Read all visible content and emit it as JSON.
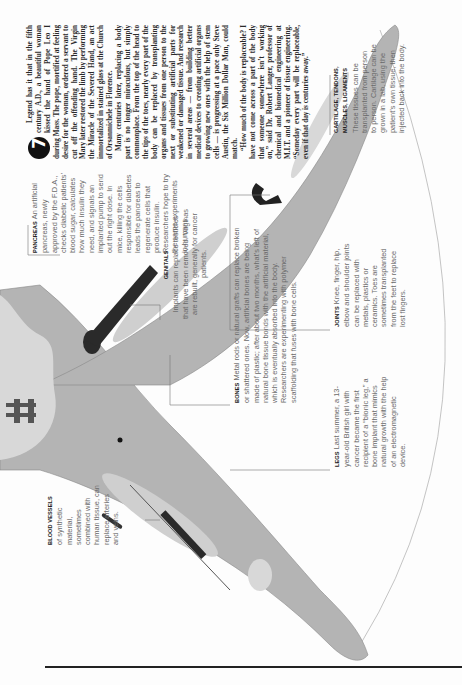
{
  "article": {
    "badge_number": "7",
    "paragraphs": [
      "Legend has it that in the fifth century A.D., a beautiful woman kissed the hand of Pope Leo I during Mass. The pope, mortified at feeling desire for the woman, ordered a servant to cut off the offending hand. The Virgin Mary later restored the limb by performing the Miracle of the Severed Hand, an act immortalized in stained glass at the Church of Orsanmichele in Florence.",
      "Many centuries later, replacing a body part is no longer miraculous, but simply commonplace. From the top of the head to the tips of the toes, nearly every part of the body can be replaced by transplanting organs and tissues from one person to the next or substituting artificial parts for weakened or damaged tissue. And research in several areas — from building better medical devices to creating artificial organs to growing new ones with the help of stem cells — is progressing at a pace only Steve Austin, the Six Million Dollar Man, could match.",
      "“How much of the body is replaceable? I have not come across a part of the body that someone somewhere isn’t working on,” said Dr. Robert Langer, professor of chemical and biomedical engineering at M.I.T. and a pioneer of tissue engineering. “Someday every part will be replaceable, even if that day is centuries away.”"
    ]
  },
  "labels": {
    "pancreas": {
      "heading": "Pancreas",
      "text": "An artificial pancreas, newly approved by the F.D.A., checks diabetic patients’ blood sugar, calculates how much insulin they need, and signals an implanted pump to send out the right dose. In mice, killing the cells responsible for diabetes leads the pancreas to regenerate cells that produce insulin. Researchers hope to try the same experiments in humans."
    },
    "cartilage": {
      "heading": "Cartilage, tendons, muscles, ligaments",
      "text": "These tissues can be transplanted from person to person. Cartilage can be grown in a lab, using the patient’s own tissue, then injected back into the body."
    },
    "joints": {
      "heading": "Joints",
      "text": "Knee, finger, hip, elbow and shoulder joints can be replaced with metals, plastics or ceramics. Toes are sometimes transplanted from the feet to replace lost fingers."
    },
    "bones": {
      "heading": "Bones",
      "text": "Metal rods or natural grafts can replace broken or shattered ones. Now, artificial bones are being made of plastic; after about two months, what’s left of natural bone tissue bonds with the artificial material, which is eventually absorbed into the body. Researchers are experimenting with polymer scaffolding that fuses with bone cells."
    },
    "genitals": {
      "heading": "Genitals",
      "text": "Implants can replace testicles that have been removed. Vaginas are rebuilt, generally for cancer patients."
    },
    "legs": {
      "heading": "Legs",
      "text": "Last summer, a 13-year-old British girl with cancer became the first recipient of a “bionic leg,” a bone implant that mimics natural growth with the help of an electromagnetic device."
    },
    "blood_vessels": {
      "heading": "Blood vessels",
      "text": "of synthetic material, sometimes combined with human tissue, can replace arteries and veins."
    }
  },
  "colors": {
    "body_fill": "#b4b4b4",
    "bone_fill": "#d8d8d8",
    "implant": "#2a2a2a",
    "rule": "#222222",
    "text_caption": "#6a6a6a",
    "text_article": "#2a2a2a"
  }
}
